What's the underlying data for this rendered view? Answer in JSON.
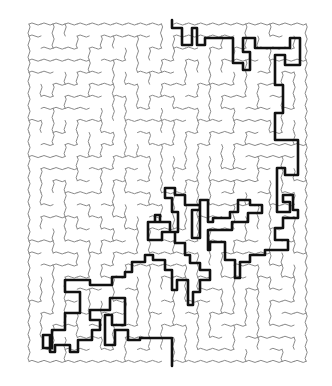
{
  "puzzle": {
    "type": "maze",
    "title": "Maze with solution path",
    "cols": 23,
    "rows": 28,
    "origin": [
      29,
      24
    ],
    "cell": 12.05,
    "seed": 7,
    "wall_color": "#8a8a8a",
    "path_color": "#111111",
    "entrance": {
      "x": 172,
      "y": 20,
      "label": "Start (top)"
    },
    "exit": {
      "x": 172,
      "y": 366,
      "label": "End (bottom)"
    }
  },
  "solution_path": [
    [
      172,
      20
    ],
    [
      172,
      28
    ],
    [
      182,
      28
    ],
    [
      182,
      45
    ],
    [
      192,
      45
    ],
    [
      192,
      28
    ],
    [
      197,
      28
    ],
    [
      197,
      45
    ],
    [
      205,
      45
    ],
    [
      205,
      38
    ],
    [
      233,
      38
    ],
    [
      233,
      63
    ],
    [
      243,
      63
    ],
    [
      243,
      70
    ],
    [
      250,
      70
    ],
    [
      250,
      52
    ],
    [
      243,
      52
    ],
    [
      243,
      38
    ],
    [
      255,
      38
    ],
    [
      255,
      48
    ],
    [
      290,
      48
    ],
    [
      290,
      38
    ],
    [
      300,
      38
    ],
    [
      300,
      65
    ],
    [
      285,
      65
    ],
    [
      285,
      55
    ],
    [
      275,
      55
    ],
    [
      275,
      85
    ],
    [
      283,
      85
    ],
    [
      283,
      113
    ],
    [
      275,
      113
    ],
    [
      275,
      140
    ],
    [
      298,
      140
    ],
    [
      298,
      175
    ],
    [
      285,
      175
    ],
    [
      285,
      168
    ],
    [
      277,
      168
    ],
    [
      277,
      212
    ],
    [
      290,
      212
    ],
    [
      290,
      202
    ],
    [
      283,
      202
    ],
    [
      283,
      195
    ],
    [
      293,
      195
    ],
    [
      293,
      210
    ],
    [
      298,
      210
    ],
    [
      298,
      218
    ],
    [
      283,
      218
    ],
    [
      283,
      228
    ],
    [
      275,
      228
    ],
    [
      275,
      240
    ],
    [
      288,
      240
    ],
    [
      288,
      250
    ],
    [
      265,
      250
    ],
    [
      265,
      255
    ],
    [
      250,
      255
    ],
    [
      250,
      262
    ],
    [
      240,
      262
    ],
    [
      240,
      278
    ],
    [
      235,
      278
    ],
    [
      235,
      260
    ],
    [
      225,
      260
    ],
    [
      225,
      242
    ],
    [
      210,
      242
    ],
    [
      210,
      250
    ],
    [
      208,
      250
    ],
    [
      208,
      230
    ],
    [
      232,
      230
    ],
    [
      232,
      222
    ],
    [
      248,
      222
    ],
    [
      248,
      213
    ],
    [
      262,
      213
    ],
    [
      262,
      205
    ],
    [
      250,
      205
    ],
    [
      250,
      200
    ],
    [
      238,
      200
    ],
    [
      238,
      212
    ],
    [
      230,
      212
    ],
    [
      230,
      218
    ],
    [
      213,
      218
    ],
    [
      213,
      222
    ],
    [
      208,
      222
    ],
    [
      208,
      200
    ],
    [
      200,
      200
    ],
    [
      200,
      210
    ],
    [
      192,
      210
    ],
    [
      192,
      238
    ],
    [
      200,
      238
    ],
    [
      200,
      205
    ],
    [
      185,
      205
    ],
    [
      185,
      195
    ],
    [
      175,
      195
    ],
    [
      175,
      188
    ],
    [
      165,
      188
    ],
    [
      165,
      198
    ],
    [
      172,
      198
    ],
    [
      172,
      212
    ],
    [
      178,
      212
    ],
    [
      178,
      232
    ],
    [
      170,
      232
    ],
    [
      170,
      222
    ],
    [
      155,
      222
    ],
    [
      155,
      215
    ],
    [
      160,
      215
    ],
    [
      160,
      222
    ],
    [
      148,
      222
    ],
    [
      148,
      240
    ],
    [
      162,
      240
    ],
    [
      162,
      232
    ],
    [
      175,
      232
    ],
    [
      175,
      243
    ],
    [
      185,
      243
    ],
    [
      185,
      255
    ],
    [
      190,
      255
    ],
    [
      190,
      263
    ],
    [
      200,
      263
    ],
    [
      200,
      270
    ],
    [
      210,
      270
    ],
    [
      210,
      280
    ],
    [
      200,
      280
    ],
    [
      200,
      292
    ],
    [
      193,
      292
    ],
    [
      193,
      305
    ],
    [
      188,
      305
    ],
    [
      188,
      280
    ],
    [
      177,
      280
    ],
    [
      177,
      290
    ],
    [
      172,
      290
    ],
    [
      172,
      270
    ],
    [
      165,
      270
    ],
    [
      165,
      260
    ],
    [
      153,
      260
    ],
    [
      153,
      255
    ],
    [
      145,
      255
    ],
    [
      145,
      262
    ],
    [
      132,
      262
    ],
    [
      132,
      272
    ],
    [
      125,
      272
    ],
    [
      125,
      277
    ],
    [
      112,
      277
    ],
    [
      112,
      285
    ],
    [
      90,
      285
    ],
    [
      90,
      280
    ],
    [
      65,
      280
    ],
    [
      65,
      292
    ],
    [
      80,
      292
    ],
    [
      80,
      313
    ],
    [
      65,
      313
    ],
    [
      65,
      330
    ],
    [
      52,
      330
    ],
    [
      52,
      348
    ],
    [
      43,
      348
    ],
    [
      43,
      335
    ],
    [
      50,
      335
    ],
    [
      50,
      352
    ],
    [
      55,
      352
    ],
    [
      55,
      345
    ],
    [
      70,
      345
    ],
    [
      70,
      352
    ],
    [
      78,
      352
    ],
    [
      78,
      340
    ],
    [
      92,
      340
    ],
    [
      92,
      330
    ],
    [
      100,
      330
    ],
    [
      100,
      320
    ],
    [
      90,
      320
    ],
    [
      90,
      310
    ],
    [
      110,
      310
    ],
    [
      110,
      298
    ],
    [
      125,
      298
    ],
    [
      125,
      325
    ],
    [
      112,
      325
    ],
    [
      112,
      315
    ],
    [
      105,
      315
    ],
    [
      105,
      345
    ],
    [
      115,
      345
    ],
    [
      115,
      330
    ],
    [
      128,
      330
    ],
    [
      128,
      340
    ],
    [
      140,
      340
    ],
    [
      140,
      338
    ],
    [
      172,
      338
    ],
    [
      172,
      366
    ]
  ]
}
